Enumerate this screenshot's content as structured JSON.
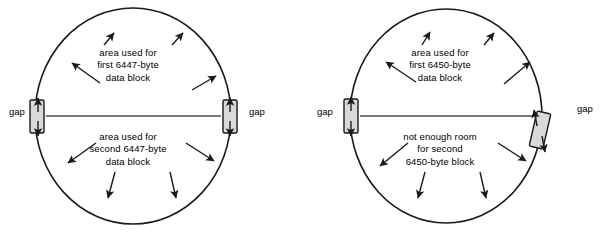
{
  "figure": {
    "background_color": "#ffffff",
    "stroke_color": "#1a1a1a",
    "gap_fill_color": "#d9d9d9",
    "center_line_color": "#4d4d4d"
  },
  "diagrams": [
    {
      "id": "left",
      "name": "track-6447-byte-blocks",
      "gap_label_west": "gap",
      "gap_label_east": "gap",
      "top_caption": [
        "area used for",
        "first 6447-byte",
        "data block"
      ],
      "bottom_caption": [
        "area used for",
        "second 6447-byte",
        "data block"
      ],
      "block_size_bytes": 6447,
      "blocks_fit": 2
    },
    {
      "id": "right",
      "name": "track-6450-byte-blocks",
      "gap_label_west": "gap",
      "gap_label_east": "gap",
      "top_caption": [
        "area used for",
        "first 6450-byte",
        "data block"
      ],
      "bottom_caption": [
        "not enough room",
        "for second",
        "6450-byte block"
      ],
      "block_size_bytes": 6450,
      "blocks_fit": 1
    }
  ]
}
